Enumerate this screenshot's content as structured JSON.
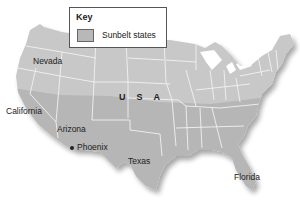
{
  "key": {
    "title": "Key",
    "items": [
      {
        "label": "Sunbelt states",
        "color": "#b8b8b8"
      }
    ]
  },
  "map": {
    "country_label": "USA",
    "land_color": "#c8c8c8",
    "sunbelt_color": "#b4b4b4",
    "border_color": "#f2f2f2",
    "labels": [
      {
        "id": "nevada",
        "text": "Nevada"
      },
      {
        "id": "california",
        "text": "California"
      },
      {
        "id": "arizona",
        "text": "Arizona"
      },
      {
        "id": "phoenix",
        "text": "Phoenix"
      },
      {
        "id": "texas",
        "text": "Texas"
      },
      {
        "id": "florida",
        "text": "Florida"
      }
    ]
  }
}
